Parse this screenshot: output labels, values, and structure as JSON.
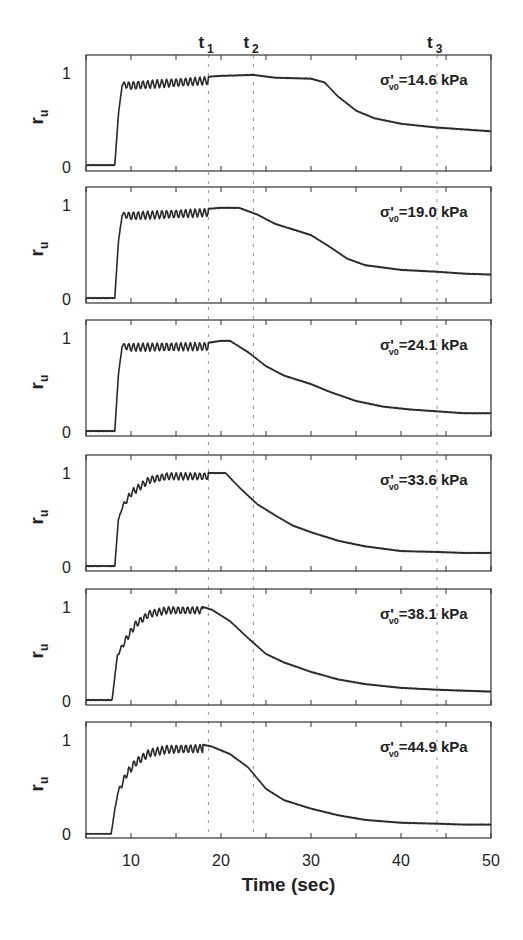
{
  "chart_data": {
    "type": "line",
    "title": "",
    "xlabel": "Time (sec)",
    "ylabel": "r_u",
    "ylabel_main": "r",
    "ylabel_sub": "u",
    "xlim": [
      5,
      50
    ],
    "ylim": [
      0,
      1
    ],
    "x_ticks": [
      5,
      10,
      15,
      20,
      25,
      30,
      35,
      40,
      45,
      50
    ],
    "x_tick_labels": [
      "10",
      "20",
      "30",
      "40",
      "50"
    ],
    "x_tick_label_values": [
      10,
      20,
      30,
      40,
      50
    ],
    "y_tick_labels": [
      "0",
      "1"
    ],
    "grid": false,
    "legend": null,
    "line_color": "#2a2a2a",
    "markers": [
      {
        "label": "t",
        "sub": "1",
        "x": 18.6
      },
      {
        "label": "t",
        "sub": "2",
        "x": 23.6
      },
      {
        "label": "t",
        "sub": "3",
        "x": 44.0
      }
    ],
    "panels": [
      {
        "annotation_prefix": "σ'",
        "annotation_sub": "v0",
        "annotation_value": "=14.6 kPa",
        "onset": 8.3,
        "osc_start_level": 0.88,
        "osc_amp": 0.08,
        "osc_end": 18.6,
        "series": [
          [
            5,
            0.02
          ],
          [
            8.2,
            0.02
          ],
          [
            8.6,
            0.55
          ],
          [
            9.0,
            0.9
          ],
          [
            18.6,
            0.96
          ],
          [
            20,
            0.97
          ],
          [
            23.6,
            0.98
          ],
          [
            26,
            0.95
          ],
          [
            30,
            0.94
          ],
          [
            31.5,
            0.9
          ],
          [
            33,
            0.75
          ],
          [
            35,
            0.6
          ],
          [
            37,
            0.52
          ],
          [
            40,
            0.46
          ],
          [
            44,
            0.42
          ],
          [
            47,
            0.4
          ],
          [
            50,
            0.38
          ]
        ]
      },
      {
        "annotation_prefix": "σ'",
        "annotation_sub": "v0",
        "annotation_value": "=19.0 kPa",
        "onset": 8.3,
        "osc_start_level": 0.9,
        "osc_amp": 0.08,
        "osc_end": 18.6,
        "series": [
          [
            5,
            0.01
          ],
          [
            8.2,
            0.01
          ],
          [
            8.6,
            0.6
          ],
          [
            9.0,
            0.92
          ],
          [
            18.6,
            0.96
          ],
          [
            20,
            0.97
          ],
          [
            22,
            0.97
          ],
          [
            24,
            0.9
          ],
          [
            26,
            0.8
          ],
          [
            28,
            0.74
          ],
          [
            30,
            0.68
          ],
          [
            32,
            0.56
          ],
          [
            34,
            0.43
          ],
          [
            36,
            0.36
          ],
          [
            40,
            0.31
          ],
          [
            44,
            0.29
          ],
          [
            47,
            0.27
          ],
          [
            50,
            0.26
          ]
        ]
      },
      {
        "annotation_prefix": "σ'",
        "annotation_sub": "v0",
        "annotation_value": "=24.1 kPa",
        "onset": 8.3,
        "osc_start_level": 0.92,
        "osc_amp": 0.08,
        "osc_end": 18.6,
        "series": [
          [
            5,
            0.01
          ],
          [
            8.2,
            0.01
          ],
          [
            8.6,
            0.6
          ],
          [
            9.0,
            0.94
          ],
          [
            18.6,
            0.95
          ],
          [
            20,
            0.97
          ],
          [
            21,
            0.97
          ],
          [
            23,
            0.85
          ],
          [
            25,
            0.7
          ],
          [
            27,
            0.6
          ],
          [
            30,
            0.51
          ],
          [
            32,
            0.43
          ],
          [
            35,
            0.33
          ],
          [
            38,
            0.27
          ],
          [
            41,
            0.24
          ],
          [
            44,
            0.22
          ],
          [
            47,
            0.2
          ],
          [
            50,
            0.2
          ]
        ]
      },
      {
        "annotation_prefix": "σ'",
        "annotation_sub": "v0",
        "annotation_value": "=33.6 kPa",
        "onset": 8.3,
        "osc_start_level": 0.75,
        "osc_amp": 0.07,
        "osc_end": 18.6,
        "series": [
          [
            5,
            0.01
          ],
          [
            8.2,
            0.01
          ],
          [
            8.6,
            0.5
          ],
          [
            9.0,
            0.65
          ],
          [
            10,
            0.82
          ],
          [
            12,
            0.96
          ],
          [
            14,
            1.0
          ],
          [
            18.6,
            1.0
          ],
          [
            20.5,
            1.0
          ],
          [
            22,
            0.85
          ],
          [
            24,
            0.67
          ],
          [
            26,
            0.55
          ],
          [
            28,
            0.44
          ],
          [
            30,
            0.37
          ],
          [
            33,
            0.28
          ],
          [
            36,
            0.22
          ],
          [
            40,
            0.17
          ],
          [
            44,
            0.16
          ],
          [
            47,
            0.15
          ],
          [
            50,
            0.15
          ]
        ]
      },
      {
        "annotation_prefix": "σ'",
        "annotation_sub": "v0",
        "annotation_value": "=38.1 kPa",
        "onset": 8.0,
        "osc_start_level": 0.55,
        "osc_amp": 0.07,
        "osc_end": 18.0,
        "series": [
          [
            5,
            0.01
          ],
          [
            7.9,
            0.01
          ],
          [
            8.5,
            0.5
          ],
          [
            9.5,
            0.7
          ],
          [
            10.5,
            0.85
          ],
          [
            12,
            0.96
          ],
          [
            14,
            1.0
          ],
          [
            18,
            1.0
          ],
          [
            19,
            0.97
          ],
          [
            21,
            0.85
          ],
          [
            23,
            0.67
          ],
          [
            25,
            0.5
          ],
          [
            27,
            0.41
          ],
          [
            30,
            0.31
          ],
          [
            33,
            0.23
          ],
          [
            36,
            0.18
          ],
          [
            40,
            0.14
          ],
          [
            44,
            0.12
          ],
          [
            47,
            0.11
          ],
          [
            50,
            0.1
          ]
        ]
      },
      {
        "annotation_prefix": "σ'",
        "annotation_sub": "v0",
        "annotation_value": "=44.9 kPa",
        "onset": 7.8,
        "osc_start_level": 0.5,
        "osc_amp": 0.08,
        "osc_end": 18.0,
        "series": [
          [
            5,
            0.0
          ],
          [
            7.8,
            0.0
          ],
          [
            8.5,
            0.45
          ],
          [
            9.5,
            0.68
          ],
          [
            10.5,
            0.8
          ],
          [
            12,
            0.9
          ],
          [
            14,
            0.94
          ],
          [
            18,
            0.95
          ],
          [
            19,
            0.93
          ],
          [
            21,
            0.85
          ],
          [
            23,
            0.71
          ],
          [
            25,
            0.48
          ],
          [
            27,
            0.36
          ],
          [
            30,
            0.27
          ],
          [
            33,
            0.2
          ],
          [
            36,
            0.15
          ],
          [
            40,
            0.12
          ],
          [
            44,
            0.11
          ],
          [
            47,
            0.1
          ],
          [
            50,
            0.1
          ]
        ]
      }
    ]
  },
  "layout": {
    "plot_left": 86,
    "plot_right": 491,
    "panel_tops": [
      55,
      187,
      320,
      455,
      589,
      722
    ],
    "panel_height": 116
  }
}
